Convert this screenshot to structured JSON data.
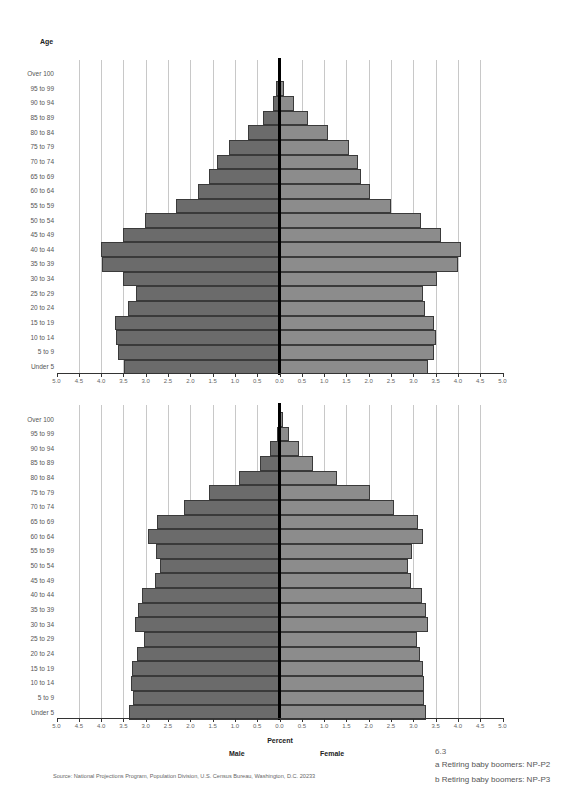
{
  "header": {
    "age_label": "Age"
  },
  "axis": {
    "ticks": [
      "5.0",
      "4.5",
      "4.0",
      "3.5",
      "3.0",
      "2.5",
      "2.0",
      "1.5",
      "1.0",
      "0.5",
      "0.0",
      "0.5",
      "1.0",
      "1.5",
      "2.0",
      "2.5",
      "3.0",
      "3.5",
      "4.0",
      "4.5",
      "5.0"
    ],
    "xlabel": "Percent",
    "male_label": "Male",
    "female_label": "Female"
  },
  "colors": {
    "male": "#6b6b6b",
    "female": "#8c8c8c",
    "center_line": "#000000",
    "grid": "#c8c8c8"
  },
  "footer": {
    "source": "Source: National Projections Program, Population Division, U.S. Census Bureau, Washington, D.C. 20233",
    "figure_number": "6.3",
    "caption_a": "a  Retiring baby boomers: NP-P2",
    "caption_b": "b  Retiring baby boomers: NP-P3"
  },
  "chart_data": [
    {
      "type": "bar",
      "orientation": "horizontal-population-pyramid",
      "title": "a Retiring baby boomers: NP-P2",
      "ylabel": "Age",
      "xlabel": "Percent",
      "xlim": [
        -5.0,
        5.0
      ],
      "grid": true,
      "categories": [
        "Over 100",
        "95 to 99",
        "90 to 94",
        "85 to 89",
        "80 to 84",
        "75 to 79",
        "70 to 74",
        "65 to 69",
        "60 to 64",
        "55 to 59",
        "50 to 54",
        "45 to 49",
        "40 to 44",
        "35 to 39",
        "30 to 34",
        "25 to 29",
        "20 to 24",
        "15 to 19",
        "10 to 14",
        "5 to 9",
        "Under 5"
      ],
      "series": [
        {
          "name": "Male",
          "values": [
            0.0,
            0.07,
            0.15,
            0.36,
            0.7,
            1.14,
            1.41,
            1.57,
            1.83,
            2.31,
            3.02,
            3.5,
            4.01,
            3.97,
            3.5,
            3.21,
            3.39,
            3.68,
            3.66,
            3.63,
            3.49
          ]
        },
        {
          "name": "Female",
          "values": [
            0.02,
            0.1,
            0.32,
            0.64,
            1.09,
            1.55,
            1.75,
            1.83,
            2.02,
            2.51,
            3.18,
            3.62,
            4.08,
            4.0,
            3.54,
            3.21,
            3.27,
            3.47,
            3.5,
            3.47,
            3.33
          ]
        }
      ]
    },
    {
      "type": "bar",
      "orientation": "horizontal-population-pyramid",
      "title": "b Retiring baby boomers: NP-P3",
      "ylabel": "Age",
      "xlabel": "Percent",
      "xlim": [
        -5.0,
        5.0
      ],
      "grid": true,
      "categories": [
        "Over 100",
        "95 to 99",
        "90 to 94",
        "85 to 89",
        "80 to 84",
        "75 to 79",
        "70 to 74",
        "65 to 69",
        "60 to 64",
        "55 to 59",
        "50 to 54",
        "45 to 49",
        "40 to 44",
        "35 to 39",
        "30 to 34",
        "25 to 29",
        "20 to 24",
        "15 to 19",
        "10 to 14",
        "5 to 9",
        "Under 5"
      ],
      "series": [
        {
          "name": "Male",
          "values": [
            0.02,
            0.06,
            0.22,
            0.43,
            0.9,
            1.58,
            2.14,
            2.74,
            2.94,
            2.77,
            2.69,
            2.8,
            3.09,
            3.17,
            3.25,
            3.03,
            3.19,
            3.3,
            3.33,
            3.29,
            3.38
          ]
        },
        {
          "name": "Female",
          "values": [
            0.08,
            0.22,
            0.44,
            0.75,
            1.3,
            2.03,
            2.56,
            3.11,
            3.21,
            2.98,
            2.88,
            2.95,
            3.2,
            3.28,
            3.33,
            3.08,
            3.14,
            3.22,
            3.23,
            3.23,
            3.29
          ]
        }
      ]
    }
  ]
}
